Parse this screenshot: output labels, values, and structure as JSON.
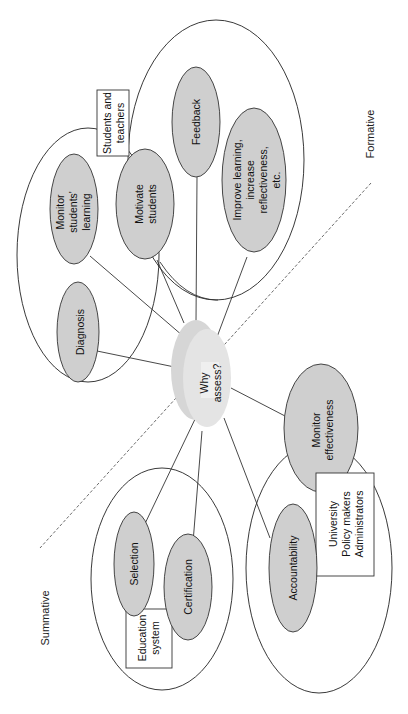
{
  "title": "Why assess?",
  "center": {
    "label_line1": "Why",
    "label_line2": "assess?"
  },
  "sides": {
    "formative": "Formative",
    "summative": "Summative"
  },
  "stakeholders": {
    "students_teachers": {
      "line1": "Students and",
      "line2": "teachers"
    },
    "education_system": {
      "line1": "Education",
      "line2": "system"
    },
    "university": {
      "line1": "University",
      "line2": "Policy makers",
      "line3": "Administrators"
    }
  },
  "nodes": {
    "diagnosis": {
      "label": "Diagnosis"
    },
    "monitor_learning": {
      "line1": "Monitor",
      "line2": "students'",
      "line3": "learning"
    },
    "motivate": {
      "line1": "Motivate",
      "line2": "students"
    },
    "feedback": {
      "label": "Feedback"
    },
    "improve": {
      "line1": "Improve learning,",
      "line2": "increase",
      "line3": "reflectiveness,",
      "line4": "etc."
    },
    "monitor_effectiveness": {
      "line1": "Monitor",
      "line2": "effectiveness"
    },
    "accountability": {
      "label": "Accountability"
    },
    "selection": {
      "label": "Selection"
    },
    "certification": {
      "label": "Certification"
    }
  },
  "colors": {
    "node_fill": "#cfcfcf",
    "stroke": "#333333",
    "background": "#ffffff"
  }
}
